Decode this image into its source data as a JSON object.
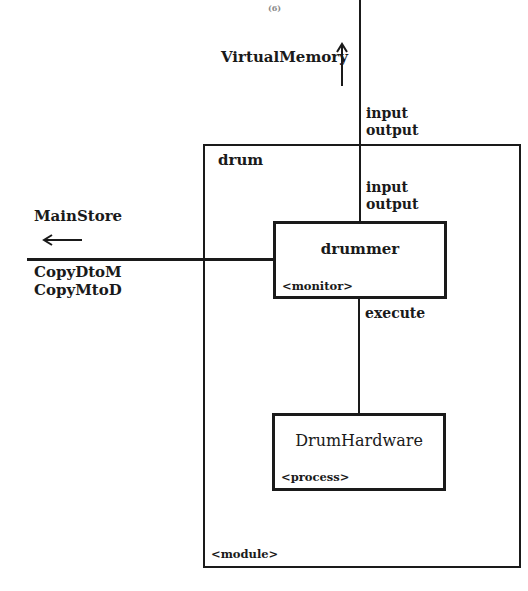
{
  "page_number": "(6)",
  "diagram": {
    "external": {
      "virtual_memory": {
        "label": "VirtualMemory",
        "direction": "up"
      },
      "main_store": {
        "label": "MainStore",
        "direction": "left"
      }
    },
    "connections": {
      "top_outer": [
        "input",
        "output"
      ],
      "top_inner": [
        "input",
        "output"
      ],
      "left": [
        "CopyDtoM",
        "CopyMtoD"
      ],
      "drummer_to_hardware": [
        "execute"
      ]
    },
    "module": {
      "name": "drum",
      "stereotype": "<module>"
    },
    "components": [
      {
        "name": "drummer",
        "stereotype": "<monitor>"
      },
      {
        "name": "DrumHardware",
        "stereotype": "<process>"
      }
    ]
  }
}
